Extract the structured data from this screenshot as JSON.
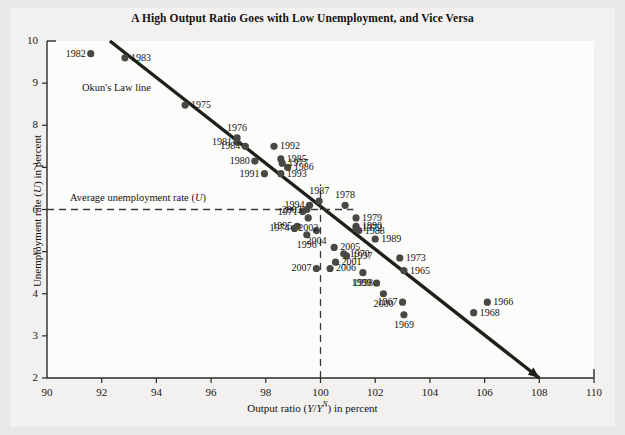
{
  "figure": {
    "title": "A High Output Ratio Goes with Low Unemployment, and Vice Versa",
    "background": "#e9e8e6",
    "plot_background": "#fcfcfb",
    "ink": "#2c2a27",
    "marker_color": "#4a4845"
  },
  "annotations": {
    "okun_line": "Okun's Law line",
    "avg_unemployment_pre": "Average unemployment rate (",
    "avg_unemployment_var": "U",
    "avg_unemployment_post": ")"
  },
  "axis": {
    "x_label_pre": "Output ratio (",
    "x_label_num": "Y",
    "x_label_slash": "/",
    "x_label_den": "Y",
    "x_label_sup": "N",
    "x_label_post": ") in percent",
    "y_label_pre": "Unemployment rate (",
    "y_label_var": "U",
    "y_label_post": ") in percent",
    "x_ticks": [
      "90",
      "92",
      "94",
      "96",
      "98",
      "100",
      "102",
      "104",
      "106",
      "108",
      "110"
    ],
    "y_ticks": [
      "2",
      "3",
      "4",
      "5",
      "6",
      "7",
      "8",
      "9",
      "10"
    ]
  },
  "chart_data": {
    "type": "scatter",
    "title": "A High Output Ratio Goes with Low Unemployment, and Vice Versa",
    "xlabel": "Output ratio (Y/Y^N) in percent",
    "ylabel": "Unemployment rate (U) in percent",
    "xlim": [
      90,
      110
    ],
    "ylim": [
      2,
      10
    ],
    "xticks": [
      90,
      92,
      94,
      96,
      98,
      100,
      102,
      104,
      106,
      108,
      110
    ],
    "yticks": [
      2,
      3,
      4,
      5,
      6,
      7,
      8,
      9,
      10
    ],
    "grid": false,
    "legend": "none",
    "reference_lines": [
      {
        "name": "okun-law-line",
        "type": "segment",
        "x0": 92.3,
        "y0": 10.0,
        "x1": 108.0,
        "y1": 2.0,
        "style": "solid",
        "label": "Okun's Law line"
      },
      {
        "name": "average-unemployment-line",
        "type": "horizontal",
        "y": 6.0,
        "x0": 90.0,
        "x1": 101.2,
        "style": "dashed",
        "label": "Average unemployment rate (U)"
      },
      {
        "name": "potential-output-line",
        "type": "vertical",
        "x": 100.0,
        "y0": 2.0,
        "y1": 6.6,
        "style": "dashed"
      }
    ],
    "point_label": "year",
    "points": [
      {
        "label": "1982",
        "x": 91.6,
        "y": 9.7,
        "label_side": "left"
      },
      {
        "label": "1983",
        "x": 92.85,
        "y": 9.6,
        "label_side": "right"
      },
      {
        "label": "1975",
        "x": 95.05,
        "y": 8.48,
        "label_side": "right"
      },
      {
        "label": "1976",
        "x": 96.95,
        "y": 7.7,
        "label_side": "above"
      },
      {
        "label": "1981",
        "x": 96.95,
        "y": 7.6,
        "label_side": "left"
      },
      {
        "label": "1984",
        "x": 97.25,
        "y": 7.5,
        "label_side": "left"
      },
      {
        "label": "1980",
        "x": 97.6,
        "y": 7.15,
        "label_side": "left"
      },
      {
        "label": "1991",
        "x": 97.95,
        "y": 6.85,
        "label_side": "left"
      },
      {
        "label": "1992",
        "x": 98.3,
        "y": 7.5,
        "label_side": "right"
      },
      {
        "label": "1985",
        "x": 98.55,
        "y": 7.2,
        "label_side": "right"
      },
      {
        "label": "1977",
        "x": 98.6,
        "y": 7.1,
        "label_side": "right"
      },
      {
        "label": "1986",
        "x": 98.8,
        "y": 7.0,
        "label_side": "right"
      },
      {
        "label": "1993",
        "x": 98.55,
        "y": 6.85,
        "label_side": "right"
      },
      {
        "label": "1994",
        "x": 99.6,
        "y": 6.1,
        "label_side": "left"
      },
      {
        "label": "2003",
        "x": 99.5,
        "y": 6.0,
        "label_side": "left"
      },
      {
        "label": "1987",
        "x": 99.95,
        "y": 6.2,
        "label_side": "above"
      },
      {
        "label": "1971",
        "x": 99.35,
        "y": 5.95,
        "label_side": "left"
      },
      {
        "label": "1995",
        "x": 99.15,
        "y": 5.6,
        "label_side": "left"
      },
      {
        "label": "1974",
        "x": 99.05,
        "y": 5.55,
        "label_side": "left"
      },
      {
        "label": "2002",
        "x": 99.55,
        "y": 5.8,
        "label_side": "below"
      },
      {
        "label": "1996",
        "x": 99.5,
        "y": 5.4,
        "label_side": "below"
      },
      {
        "label": "2004",
        "x": 99.85,
        "y": 5.5,
        "label_side": "below"
      },
      {
        "label": "2007",
        "x": 99.85,
        "y": 4.6,
        "label_side": "left"
      },
      {
        "label": "2005",
        "x": 100.5,
        "y": 5.1,
        "label_side": "right"
      },
      {
        "label": "2006",
        "x": 100.35,
        "y": 4.6,
        "label_side": "right"
      },
      {
        "label": "2001",
        "x": 100.55,
        "y": 4.75,
        "label_side": "right"
      },
      {
        "label": "1978",
        "x": 100.9,
        "y": 6.1,
        "label_side": "above"
      },
      {
        "label": "1979",
        "x": 101.3,
        "y": 5.8,
        "label_side": "right"
      },
      {
        "label": "1990",
        "x": 101.3,
        "y": 5.6,
        "label_side": "right"
      },
      {
        "label": "1972",
        "x": 101.3,
        "y": 5.55,
        "label_side": "right"
      },
      {
        "label": "1988",
        "x": 101.4,
        "y": 5.5,
        "label_side": "right"
      },
      {
        "label": "1970",
        "x": 100.85,
        "y": 4.95,
        "label_side": "right"
      },
      {
        "label": "1997",
        "x": 100.95,
        "y": 4.9,
        "label_side": "right"
      },
      {
        "label": "1989",
        "x": 102.0,
        "y": 5.3,
        "label_side": "right"
      },
      {
        "label": "1998",
        "x": 101.55,
        "y": 4.5,
        "label_side": "below"
      },
      {
        "label": "1999",
        "x": 102.05,
        "y": 4.25,
        "label_side": "left"
      },
      {
        "label": "1973",
        "x": 102.9,
        "y": 4.85,
        "label_side": "right"
      },
      {
        "label": "1965",
        "x": 103.05,
        "y": 4.55,
        "label_side": "right"
      },
      {
        "label": "2000",
        "x": 102.3,
        "y": 4.0,
        "label_side": "below"
      },
      {
        "label": "1967",
        "x": 103.0,
        "y": 3.8,
        "label_side": "left"
      },
      {
        "label": "1969",
        "x": 103.05,
        "y": 3.5,
        "label_side": "below"
      },
      {
        "label": "1966",
        "x": 106.1,
        "y": 3.8,
        "label_side": "right"
      },
      {
        "label": "1968",
        "x": 105.6,
        "y": 3.55,
        "label_side": "right"
      }
    ]
  }
}
